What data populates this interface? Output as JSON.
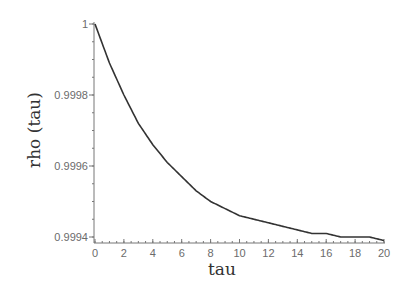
{
  "chart_data": {
    "type": "line",
    "title": "",
    "xlabel": "tau",
    "ylabel": "rho (tau)",
    "xlim": [
      0,
      20
    ],
    "ylim": [
      0.99938,
      1.0
    ],
    "grid": false,
    "legend": null,
    "x_ticks": [
      0,
      2,
      4,
      6,
      8,
      10,
      12,
      14,
      16,
      18,
      20
    ],
    "x_tick_labels": [
      "0",
      "2",
      "4",
      "6",
      "8",
      "10",
      "12",
      "14",
      "16",
      "18",
      "20"
    ],
    "y_ticks": [
      0.9994,
      0.9996,
      0.9998,
      1.0
    ],
    "y_tick_labels": [
      "0.9994",
      "0.9996",
      "0.9998",
      "1"
    ],
    "series": [
      {
        "name": "rho(tau)",
        "color": "#333333",
        "x": [
          0,
          1,
          2,
          3,
          4,
          5,
          6,
          7,
          8,
          9,
          10,
          11,
          12,
          13,
          14,
          15,
          16,
          17,
          18,
          19,
          20
        ],
        "y": [
          1.0,
          0.99989,
          0.9998,
          0.99972,
          0.99966,
          0.99961,
          0.99957,
          0.99953,
          0.9995,
          0.99948,
          0.99946,
          0.99945,
          0.99944,
          0.99943,
          0.99942,
          0.99941,
          0.99941,
          0.9994,
          0.9994,
          0.9994,
          0.99939
        ]
      }
    ]
  },
  "labels": {
    "xlabel": "tau",
    "ylabel": "rho (tau)"
  }
}
